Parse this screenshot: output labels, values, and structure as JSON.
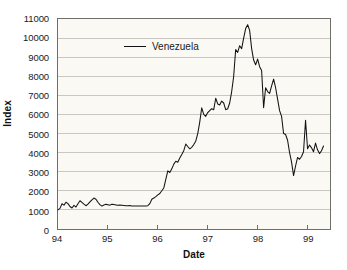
{
  "chart_data": {
    "type": "line",
    "title": "",
    "xlabel": "Date",
    "ylabel": "Index",
    "xlim": [
      94.0,
      99.45
    ],
    "ylim": [
      0,
      11000
    ],
    "grid": true,
    "legend_position": "top-left",
    "x_tick_labels": [
      "94",
      "95",
      "96",
      "97",
      "98",
      "99"
    ],
    "x_tick_values": [
      94,
      95,
      96,
      97,
      98,
      99
    ],
    "y_tick_labels": [
      "0",
      "1000",
      "2000",
      "3000",
      "4000",
      "5000",
      "6000",
      "7000",
      "8000",
      "9000",
      "10000",
      "11000"
    ],
    "y_tick_values": [
      0,
      1000,
      2000,
      3000,
      4000,
      5000,
      6000,
      7000,
      8000,
      9000,
      10000,
      11000
    ],
    "series": [
      {
        "name": "Venezuela",
        "color": "#121212",
        "x": [
          94.0,
          94.04,
          94.08,
          94.12,
          94.16,
          94.2,
          94.24,
          94.28,
          94.32,
          94.36,
          94.4,
          94.44,
          94.48,
          94.52,
          94.56,
          94.6,
          94.64,
          94.68,
          94.72,
          94.76,
          94.8,
          94.84,
          94.88,
          94.92,
          94.96,
          95.0,
          95.04,
          95.08,
          95.12,
          95.16,
          95.2,
          95.24,
          95.28,
          95.32,
          95.36,
          95.4,
          95.44,
          95.48,
          95.52,
          95.56,
          95.6,
          95.64,
          95.68,
          95.72,
          95.76,
          95.8,
          95.84,
          95.88,
          95.92,
          95.96,
          96.0,
          96.04,
          96.08,
          96.12,
          96.16,
          96.2,
          96.24,
          96.28,
          96.32,
          96.36,
          96.4,
          96.44,
          96.48,
          96.52,
          96.56,
          96.6,
          96.64,
          96.68,
          96.72,
          96.76,
          96.8,
          96.84,
          96.88,
          96.92,
          96.96,
          97.0,
          97.04,
          97.08,
          97.12,
          97.16,
          97.2,
          97.24,
          97.28,
          97.32,
          97.36,
          97.4,
          97.44,
          97.48,
          97.52,
          97.56,
          97.6,
          97.64,
          97.68,
          97.72,
          97.76,
          97.8,
          97.84,
          97.88,
          97.92,
          97.96,
          98.0,
          98.04,
          98.08,
          98.12,
          98.16,
          98.2,
          98.24,
          98.28,
          98.32,
          98.36,
          98.4,
          98.44,
          98.48,
          98.52,
          98.56,
          98.6,
          98.64,
          98.68,
          98.72,
          98.76,
          98.8,
          98.84,
          98.88,
          98.92,
          98.96,
          99.0,
          99.04,
          99.08,
          99.12,
          99.16,
          99.2,
          99.24,
          99.28,
          99.32
        ],
        "values": [
          1000,
          1080,
          1320,
          1250,
          1400,
          1330,
          1180,
          1100,
          1240,
          1150,
          1320,
          1480,
          1390,
          1300,
          1220,
          1300,
          1420,
          1530,
          1620,
          1560,
          1400,
          1280,
          1200,
          1260,
          1290,
          1270,
          1250,
          1300,
          1280,
          1260,
          1240,
          1250,
          1240,
          1230,
          1220,
          1220,
          1230,
          1210,
          1200,
          1200,
          1200,
          1210,
          1200,
          1200,
          1210,
          1220,
          1330,
          1560,
          1620,
          1700,
          1790,
          1860,
          2000,
          2150,
          2600,
          3050,
          2960,
          3150,
          3400,
          3550,
          3500,
          3720,
          3900,
          4100,
          4450,
          4320,
          4200,
          4280,
          4420,
          4600,
          5000,
          5600,
          6350,
          6000,
          5900,
          6100,
          6200,
          6300,
          6250,
          6850,
          6550,
          6500,
          6700,
          6600,
          6250,
          6300,
          6600,
          7200,
          8000,
          9400,
          9250,
          9600,
          9450,
          10000,
          10500,
          10700,
          10400,
          9450,
          8850,
          8600,
          8900,
          8500,
          8300,
          6350,
          7400,
          7200,
          7100,
          7500,
          7850,
          7400,
          6800,
          6200,
          5900,
          5000,
          4950,
          4650,
          4000,
          3500,
          2800,
          3300,
          3750,
          3650,
          3800,
          4050,
          5700,
          4200,
          4400,
          4250,
          4050,
          4500,
          4150,
          3950,
          4100,
          4350
        ],
        "peak_value": 10700,
        "peak_x": 97.8,
        "min_value": 1000,
        "min_x": 94.0,
        "end_value": 4350
      }
    ]
  },
  "legend": {
    "label": "Venezuela"
  },
  "axes": {
    "y_title": "Index",
    "x_title": "Date"
  }
}
